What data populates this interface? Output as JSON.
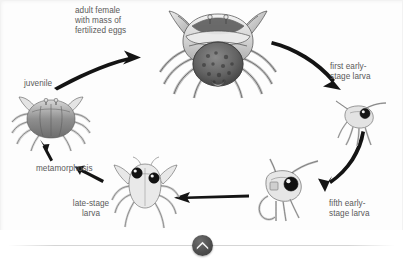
{
  "diagram": {
    "type": "cycle-diagram",
    "background_color": "#fdfdfd",
    "text_color": "#5a5a5a",
    "arrow_color": "#111111",
    "stages": [
      {
        "id": "adult-female",
        "label": "adult female\nwith mass of\nfertilized eggs",
        "organism": "adult crab with egg mass"
      },
      {
        "id": "first-early-stage-larva",
        "label": "first early-\nstage larva",
        "organism": "zoea larva"
      },
      {
        "id": "fifth-early-stage-larva",
        "label": "fifth early-\nstage larva",
        "organism": "zoea larva"
      },
      {
        "id": "late-stage-larva",
        "label": "late-stage\nlarva",
        "organism": "megalopa larva"
      },
      {
        "id": "juvenile",
        "label": "juvenile",
        "organism": "juvenile crab"
      }
    ],
    "transitions": [
      {
        "id": "metamorphosis",
        "label": "metamorphosis",
        "from": "late-stage-larva",
        "to": "juvenile"
      }
    ]
  },
  "bottom_bar": {
    "collapse_button": {
      "icon": "chevron-up-icon",
      "color": "#4e4e4e"
    }
  }
}
